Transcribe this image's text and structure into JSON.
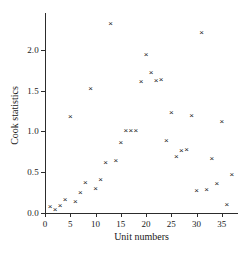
{
  "chart_data": {
    "type": "scatter",
    "title": "",
    "xlabel": "Unit numbers",
    "ylabel": "Cook statistics",
    "xlim": [
      0,
      38
    ],
    "ylim": [
      0.0,
      2.45
    ],
    "xticks": [
      0,
      5,
      10,
      15,
      20,
      25,
      30,
      35
    ],
    "xticklabels": [
      "0",
      "5",
      "10",
      "15",
      "20",
      "25",
      "30",
      "35"
    ],
    "yticks": [
      0.0,
      0.5,
      1.0,
      1.5,
      2.0
    ],
    "yticklabels": [
      "0.0",
      "0.5",
      "1.0",
      "1.5",
      "2.0"
    ],
    "grid": false,
    "legend": null,
    "marker": "x",
    "marker_color": "#1a1a1a",
    "points": [
      {
        "x": 1,
        "y": 0.07
      },
      {
        "x": 2,
        "y": 0.04
      },
      {
        "x": 3,
        "y": 0.08
      },
      {
        "x": 4,
        "y": 0.16
      },
      {
        "x": 5,
        "y": 1.18
      },
      {
        "x": 6,
        "y": 0.13
      },
      {
        "x": 7,
        "y": 0.24
      },
      {
        "x": 8,
        "y": 0.37
      },
      {
        "x": 9,
        "y": 1.52
      },
      {
        "x": 10,
        "y": 0.29
      },
      {
        "x": 11,
        "y": 0.4
      },
      {
        "x": 12,
        "y": 0.61
      },
      {
        "x": 13,
        "y": 2.32
      },
      {
        "x": 14,
        "y": 0.64
      },
      {
        "x": 15,
        "y": 0.86
      },
      {
        "x": 16,
        "y": 1.0
      },
      {
        "x": 17,
        "y": 1.0
      },
      {
        "x": 18,
        "y": 1.01
      },
      {
        "x": 19,
        "y": 1.61
      },
      {
        "x": 20,
        "y": 1.94
      },
      {
        "x": 21,
        "y": 1.72
      },
      {
        "x": 22,
        "y": 1.62
      },
      {
        "x": 23,
        "y": 1.63
      },
      {
        "x": 24,
        "y": 0.88
      },
      {
        "x": 25,
        "y": 1.22
      },
      {
        "x": 26,
        "y": 0.69
      },
      {
        "x": 27,
        "y": 0.76
      },
      {
        "x": 28,
        "y": 0.77
      },
      {
        "x": 29,
        "y": 1.19
      },
      {
        "x": 30,
        "y": 0.27
      },
      {
        "x": 31,
        "y": 2.21
      },
      {
        "x": 32,
        "y": 0.28
      },
      {
        "x": 33,
        "y": 0.66
      },
      {
        "x": 34,
        "y": 0.35
      },
      {
        "x": 35,
        "y": 1.12
      },
      {
        "x": 36,
        "y": 0.1
      },
      {
        "x": 37,
        "y": 0.47
      }
    ]
  }
}
